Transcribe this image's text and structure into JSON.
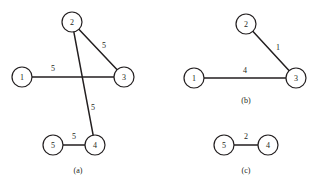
{
  "figure": {
    "background_color": "#ffffff",
    "ink_color": "#231f20",
    "node_fill_color": "#ffffff"
  },
  "chart_data": {
    "type": "diagram",
    "title": "",
    "subtitle": "",
    "xlabel": "",
    "ylabel": "",
    "grid": false,
    "legend": "none",
    "panels": [
      {
        "id": "a",
        "caption": "(a)",
        "caption_x": 78,
        "caption_y": 170,
        "node_radius": 10,
        "nodes": [
          {
            "id": "a1",
            "label": "1",
            "x": 22,
            "y": 77
          },
          {
            "id": "a2",
            "label": "2",
            "x": 72,
            "y": 22
          },
          {
            "id": "a3",
            "label": "3",
            "x": 124,
            "y": 77
          },
          {
            "id": "a4",
            "label": "4",
            "x": 95,
            "y": 145
          },
          {
            "id": "a5",
            "label": "5",
            "x": 53,
            "y": 145
          }
        ],
        "edges": [
          {
            "from": "a1",
            "to": "a3",
            "weight": "5",
            "label_x": 53,
            "label_y": 68
          },
          {
            "from": "a2",
            "to": "a3",
            "weight": "5",
            "label_x": 104,
            "label_y": 45
          },
          {
            "from": "a2",
            "to": "a4",
            "weight": "5",
            "label_x": 93,
            "label_y": 107
          },
          {
            "from": "a5",
            "to": "a4",
            "weight": "5",
            "label_x": 74,
            "label_y": 136
          }
        ]
      },
      {
        "id": "b",
        "caption": "(b)",
        "caption_x": 246,
        "caption_y": 100,
        "node_radius": 10,
        "nodes": [
          {
            "id": "b1",
            "label": "1",
            "x": 194,
            "y": 78
          },
          {
            "id": "b2",
            "label": "2",
            "x": 246,
            "y": 24
          },
          {
            "id": "b3",
            "label": "3",
            "x": 296,
            "y": 78
          }
        ],
        "edges": [
          {
            "from": "b1",
            "to": "b3",
            "weight": "4",
            "label_x": 245,
            "label_y": 70
          },
          {
            "from": "b2",
            "to": "b3",
            "weight": "1",
            "label_x": 278,
            "label_y": 47
          }
        ]
      },
      {
        "id": "c",
        "caption": "(c)",
        "caption_x": 246,
        "caption_y": 170,
        "node_radius": 10,
        "nodes": [
          {
            "id": "c5",
            "label": "5",
            "x": 224,
            "y": 145
          },
          {
            "id": "c4",
            "label": "4",
            "x": 268,
            "y": 145
          }
        ],
        "edges": [
          {
            "from": "c5",
            "to": "c4",
            "weight": "2",
            "label_x": 246,
            "label_y": 136
          }
        ]
      }
    ]
  }
}
